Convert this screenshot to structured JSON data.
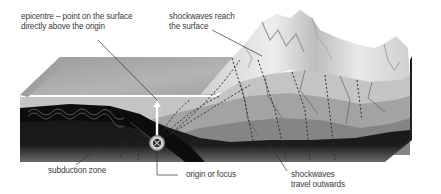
{
  "diagram": {
    "labels": {
      "epicentre_line1": "epicentre – point on the surface",
      "epicentre_line2": "directly above the origin",
      "shockwaves_reach_line1": "shockwaves reach",
      "shockwaves_reach_line2": "the surface",
      "subduction_zone": "subduction zone",
      "origin": "origin or focus",
      "shockwaves_travel_line1": "shockwaves",
      "shockwaves_travel_line2": "travel outwards"
    },
    "colors": {
      "background": "#ffffff",
      "label_text": "#3a3a3a",
      "leader_line": "#333333",
      "flat_top": "#a6a6a6",
      "mountain_light": "#e4e4e4",
      "layer_1": "#bdbdbd",
      "layer_2": "#9e9e9e",
      "layer_3": "#7f7f7f",
      "mantle": "#1e1e1e",
      "subducting_plate": "#0f0f0f",
      "side_face": "#2a2a2a"
    }
  }
}
